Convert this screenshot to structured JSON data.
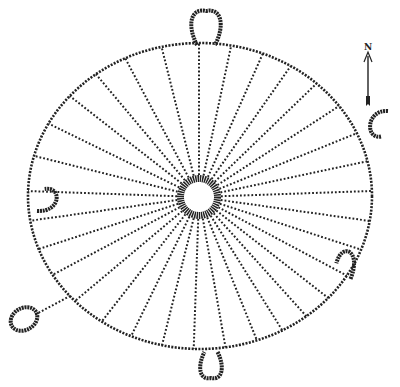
{
  "diagram": {
    "type": "medicine-wheel",
    "north_label": "N",
    "colors": {
      "ink": "#222222",
      "background": "#ffffff"
    },
    "outer_ring": {
      "cx": 200,
      "cy": 196,
      "rx": 172,
      "ry": 153
    },
    "hub": {
      "cx": 199,
      "cy": 197,
      "r_outer": 22,
      "r_inner": 15
    },
    "spoke_angles_deg": [
      -90,
      -78,
      -66,
      -55,
      -44,
      -33,
      -22,
      -12,
      -2,
      8,
      18,
      28,
      38,
      48,
      58,
      68,
      80,
      92,
      104,
      116,
      128,
      140,
      152,
      162,
      172,
      182,
      194,
      206,
      218,
      230,
      242,
      256
    ],
    "cairns": [
      {
        "name": "north-cairn",
        "shape": "loop",
        "x": 206,
        "y": 28,
        "w": 30,
        "h": 34,
        "rot": 0
      },
      {
        "name": "east-cairn",
        "shape": "hook",
        "x": 378,
        "y": 126,
        "w": 30,
        "h": 20,
        "rot": 90
      },
      {
        "name": "southeast-cairn",
        "shape": "hook",
        "x": 345,
        "y": 262,
        "w": 22,
        "h": 28,
        "rot": 200
      },
      {
        "name": "south-cairn",
        "shape": "loop",
        "x": 211,
        "y": 365,
        "w": 22,
        "h": 26,
        "rot": 180
      },
      {
        "name": "west-cairn",
        "shape": "hook",
        "x": 48,
        "y": 198,
        "w": 26,
        "h": 22,
        "rot": -90
      },
      {
        "name": "southwest-cairn",
        "shape": "ring",
        "x": 24,
        "y": 319,
        "w": 28,
        "h": 22,
        "rot": -30,
        "connector_to": [
          70,
          296
        ]
      }
    ]
  }
}
